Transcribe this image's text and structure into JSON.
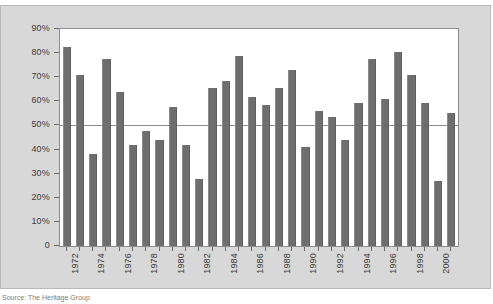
{
  "figure": {
    "source_note": "Source: The Heritage Group",
    "panel_color": "#d8d8d8",
    "plot_background": "#ffffff",
    "bar_color": "#6e6e6e",
    "axis_color": "#8e8e8e"
  },
  "chart_data": {
    "type": "bar",
    "title": "",
    "subtitle": "",
    "xlabel": "",
    "ylabel": "",
    "ylim": [
      0,
      90
    ],
    "ytick_labels": [
      "90%",
      "80%",
      "70%",
      "60%",
      "50%",
      "40%",
      "30%",
      "20%",
      "10%",
      "0"
    ],
    "ytick_values": [
      90,
      80,
      70,
      60,
      50,
      40,
      30,
      20,
      10,
      0
    ],
    "gridlines": [
      50
    ],
    "grid": false,
    "legend": null,
    "legend_position": "none",
    "xtick_labels": [
      "1972",
      "1974",
      "1976",
      "1978",
      "1980",
      "1982",
      "1984",
      "1986",
      "1988",
      "1990",
      "1992",
      "1994",
      "1996",
      "1998",
      "2000"
    ],
    "xtick_label_rotation": -90,
    "categories": [
      "1972",
      "1973",
      "1974",
      "1975",
      "1976",
      "1977",
      "1978",
      "1979",
      "1980",
      "1981",
      "1982",
      "1983",
      "1984",
      "1985",
      "1986",
      "1987",
      "1988",
      "1989",
      "1990",
      "1991",
      "1992",
      "1993",
      "1994",
      "1995",
      "1996",
      "1997",
      "1998",
      "1999",
      "2000",
      "2001"
    ],
    "values": [
      82.5,
      71,
      38,
      77.5,
      64,
      42,
      47.5,
      44,
      57.5,
      42,
      28,
      65.5,
      68.5,
      79,
      62,
      58.5,
      65.5,
      73,
      41,
      56,
      53.5,
      44,
      59.5,
      77.5,
      61,
      80.5,
      71,
      59.5,
      27,
      55
    ],
    "value_unit": "%"
  }
}
